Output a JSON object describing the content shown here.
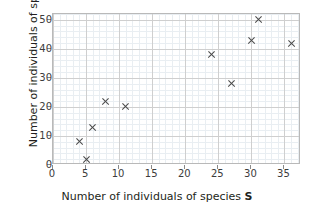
{
  "chart_data": {
    "type": "scatter",
    "title": "",
    "xlabel": "Number of individuals of species S",
    "xlabel_plain": "Number of individuals of species ",
    "xlabel_variable": "S",
    "ylabel": "Number of individuals of species R",
    "ylabel_plain": "Number of individuals of species ",
    "ylabel_variable": "R",
    "xlim": [
      0,
      37.5
    ],
    "ylim": [
      0,
      52
    ],
    "xticks": [
      0,
      5,
      10,
      15,
      20,
      25,
      30,
      35
    ],
    "yticks": [
      0,
      10,
      20,
      30,
      40,
      50
    ],
    "xticklabels": [
      "0",
      "5",
      "10",
      "15",
      "20",
      "25",
      "30",
      "35"
    ],
    "yticklabels": [
      "0",
      "10",
      "20",
      "30",
      "40",
      "50"
    ],
    "grid": true,
    "grid_minor": true,
    "legend": false,
    "marker": "x",
    "marker_color": "#4a4a4a",
    "points": [
      {
        "x": 4,
        "y": 8
      },
      {
        "x": 5,
        "y": 2
      },
      {
        "x": 6,
        "y": 13
      },
      {
        "x": 8,
        "y": 22
      },
      {
        "x": 11,
        "y": 20
      },
      {
        "x": 24,
        "y": 38
      },
      {
        "x": 27,
        "y": 28
      },
      {
        "x": 30,
        "y": 43
      },
      {
        "x": 31,
        "y": 50
      },
      {
        "x": 36,
        "y": 42
      }
    ],
    "colors": {
      "marker": "#4a4a4a",
      "grid_major": "#cfcfcf",
      "grid_minor": "#e9eef2",
      "axis": "#b9b9b9",
      "tick": "#8a8a8a",
      "text": "#231f20",
      "tick_text": "#3c3c3c",
      "background": "#ffffff"
    }
  }
}
